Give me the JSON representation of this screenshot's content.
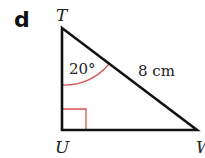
{
  "part_label": "d",
  "vertices": {
    "top": "T",
    "right_angle": "U",
    "right": "W"
  },
  "angle_label": "20°",
  "side_label": "8 cm",
  "colors": {
    "lines": "#111111",
    "marks": "#d9534f"
  }
}
